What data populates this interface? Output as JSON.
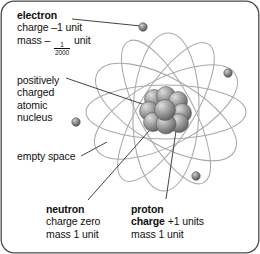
{
  "figure": {
    "frame_color": "#4a4a4a",
    "background": "#ffffff"
  },
  "labels": {
    "electron": {
      "heading": "electron",
      "line1": "charge –1 unit",
      "line2_prefix": "mass –",
      "fraction_numerator": "1",
      "fraction_denominator": "2000",
      "line2_suffix": "unit"
    },
    "nucleus": {
      "line1": "positively",
      "line2": "charged",
      "line3": "atomic",
      "line4": "nucleus"
    },
    "empty_space": {
      "text": "empty space"
    },
    "neutron": {
      "heading": "neutron",
      "line1": "charge zero",
      "line2": "mass 1 unit"
    },
    "proton": {
      "heading": "proton",
      "line1_bold": "charge",
      "line1_rest": "+1 units",
      "line2": "mass 1 unit"
    }
  },
  "diagram": {
    "nucleus_center": {
      "x": 166,
      "y": 112
    },
    "nucleus_particle_color": "#8d8d8d",
    "orbit_color": "#a9a9a9",
    "leader_color": "#3a3a3a",
    "electron_color": "#7a7a7a",
    "orbits": [
      {
        "rx": 78,
        "ry": 26,
        "rotate": 0
      },
      {
        "rx": 78,
        "ry": 26,
        "rotate": 60
      },
      {
        "rx": 78,
        "ry": 26,
        "rotate": 120
      },
      {
        "rx": 78,
        "ry": 30,
        "rotate": 30
      },
      {
        "rx": 78,
        "ry": 30,
        "rotate": 95
      },
      {
        "rx": 78,
        "ry": 30,
        "rotate": 150
      }
    ],
    "electrons": [
      {
        "x": 143,
        "y": 27,
        "name": "electron-top"
      },
      {
        "x": 228,
        "y": 73,
        "name": "electron-right"
      },
      {
        "x": 76,
        "y": 122,
        "name": "electron-left"
      },
      {
        "x": 196,
        "y": 176,
        "name": "electron-bottom-right"
      }
    ],
    "nucleons": [
      {
        "x": -12,
        "y": -13,
        "r": 9.5
      },
      {
        "x": 0,
        "y": -16,
        "r": 9.5
      },
      {
        "x": 12,
        "y": -11,
        "r": 9.5
      },
      {
        "x": -17,
        "y": -1,
        "r": 9.5
      },
      {
        "x": -4,
        "y": -3,
        "r": 10.5
      },
      {
        "x": 15,
        "y": 1,
        "r": 9.5
      },
      {
        "x": -13,
        "y": 10,
        "r": 9.5
      },
      {
        "x": 0,
        "y": 12,
        "r": 10
      },
      {
        "x": 13,
        "y": 11,
        "r": 9.5
      }
    ],
    "leaders": [
      {
        "name": "leader-electron",
        "x1": 72,
        "y1": 19,
        "x2": 141,
        "y2": 26
      },
      {
        "name": "leader-nucleus",
        "x1": 66,
        "y1": 78,
        "x2": 150,
        "y2": 106
      },
      {
        "name": "leader-empty",
        "x1": 80,
        "y1": 156,
        "x2": 105,
        "y2": 143
      },
      {
        "name": "leader-neutron",
        "x1": 88,
        "y1": 201,
        "x2": 156,
        "y2": 122
      },
      {
        "name": "leader-proton",
        "x1": 166,
        "y1": 200,
        "x2": 176,
        "y2": 124
      }
    ]
  }
}
